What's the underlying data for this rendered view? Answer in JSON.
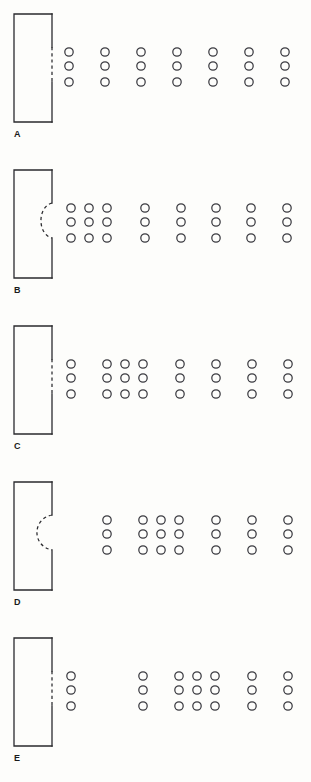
{
  "figure": {
    "background_color": "#fdfdfb",
    "ink_color": "#2a2a2e",
    "circle_color": "#3a3a40",
    "panel_count": 5,
    "panels": [
      {
        "id": "A",
        "label": "A",
        "label_x": 14,
        "label_y": 130,
        "rect": {
          "x": 14,
          "y": 14,
          "width": 38,
          "height": 108
        },
        "boundary": {
          "type": "straight-dashed",
          "x": 52,
          "y_top": 47,
          "y_bottom": 82,
          "bulge": 0
        },
        "rows_y": [
          52,
          66,
          82
        ],
        "columns_x": [
          69,
          105,
          141,
          177,
          213,
          249,
          285
        ],
        "column_count": 7,
        "row_count": 3,
        "circle_radius": 4.2
      },
      {
        "id": "B",
        "label": "B",
        "label_x": 14,
        "label_y": 286,
        "rect": {
          "x": 14,
          "y": 170,
          "width": 38,
          "height": 108
        },
        "boundary": {
          "type": "curved-dashed",
          "x": 52,
          "y_top": 203,
          "y_bottom": 238,
          "bulge": -11
        },
        "rows_y": [
          208,
          222,
          238
        ],
        "columns_x": [
          71,
          89,
          107,
          145,
          181,
          216,
          251,
          287
        ],
        "column_count": 8,
        "row_count": 3,
        "circle_radius": 4.2
      },
      {
        "id": "C",
        "label": "C",
        "label_x": 14,
        "label_y": 442,
        "rect": {
          "x": 14,
          "y": 326,
          "width": 38,
          "height": 108
        },
        "boundary": {
          "type": "straight-dashed",
          "x": 52,
          "y_top": 359,
          "y_bottom": 394,
          "bulge": 0
        },
        "rows_y": [
          364,
          378,
          394
        ],
        "columns_x": [
          71,
          107,
          125,
          143,
          180,
          216,
          252,
          288
        ],
        "column_count": 8,
        "row_count": 3,
        "circle_radius": 4.2
      },
      {
        "id": "D",
        "label": "D",
        "label_x": 14,
        "label_y": 598,
        "rect": {
          "x": 14,
          "y": 482,
          "width": 38,
          "height": 108
        },
        "boundary": {
          "type": "curved-dashed",
          "x": 52,
          "y_top": 515,
          "y_bottom": 550,
          "bulge": -15
        },
        "rows_y": [
          520,
          534,
          550
        ],
        "columns_x": [
          107,
          143,
          161,
          179,
          216,
          252,
          288
        ],
        "column_count": 7,
        "row_count": 3,
        "circle_radius": 4.2
      },
      {
        "id": "E",
        "label": "E",
        "label_x": 14,
        "label_y": 754,
        "rect": {
          "x": 14,
          "y": 638,
          "width": 38,
          "height": 108
        },
        "boundary": {
          "type": "straight-dashed",
          "x": 52,
          "y_top": 671,
          "y_bottom": 706,
          "bulge": 0
        },
        "rows_y": [
          676,
          690,
          706
        ],
        "columns_x": [
          71,
          143,
          179,
          197,
          215,
          252,
          288
        ],
        "column_count": 7,
        "row_count": 3,
        "circle_radius": 4.2
      }
    ]
  }
}
